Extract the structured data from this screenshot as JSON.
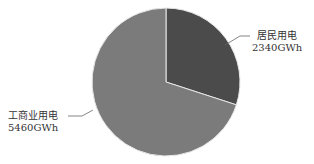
{
  "chart_data": {
    "type": "pie",
    "title": "",
    "categories": [
      "居民用电",
      "工商业用电"
    ],
    "values": [
      2340,
      5460
    ],
    "unit": "GWh",
    "labels": [
      "居民用电\n2340GWh",
      "工商业用电\n5460GWh"
    ],
    "colors": [
      "#4b4b4b",
      "#7b7b7b"
    ],
    "start_angle": "12 o'clock, clockwise",
    "legend": "none"
  },
  "labels": {
    "residential": {
      "name": "居民用电",
      "value": "2340GWh"
    },
    "commercial": {
      "name": "工商业用电",
      "value": "5460GWh"
    }
  }
}
